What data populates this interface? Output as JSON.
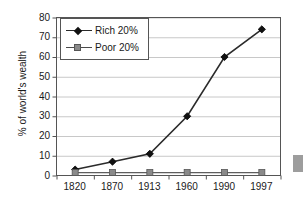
{
  "chart_data": {
    "type": "line",
    "title": "",
    "subtitle": "",
    "xlabel": "",
    "ylabel": "% of world's wealth",
    "categories": [
      "1820",
      "1870",
      "1913",
      "1960",
      "1990",
      "1997"
    ],
    "series": [
      {
        "name": "Rich 20%",
        "marker": "diamond",
        "color": "#111111",
        "values": [
          3,
          7,
          11,
          30,
          60,
          74
        ]
      },
      {
        "name": "Poor 20%",
        "marker": "square",
        "color": "#8a8a8a",
        "values": [
          1.5,
          1.5,
          1.5,
          1.5,
          1.5,
          1.5
        ]
      }
    ],
    "ylim": [
      0,
      80
    ],
    "y_ticks": [
      "0",
      "10",
      "20",
      "30",
      "40",
      "50",
      "60",
      "70",
      "80"
    ],
    "grid": "horizontal",
    "legend_position": "upper-left-inside"
  },
  "legend": {
    "items": [
      {
        "label": "Rich 20%",
        "marker": "diamond-marker-icon"
      },
      {
        "label": "Poor 20%",
        "marker": "square-marker-icon"
      }
    ]
  },
  "colors": {
    "background": "#ffffff",
    "axis": "#555555",
    "gridline": "#c8c8c8",
    "rich_line": "#2b2b2b",
    "poor_line": "#5e5e5e",
    "text": "#1a1a1a",
    "artifact": "#9d9d9d"
  }
}
